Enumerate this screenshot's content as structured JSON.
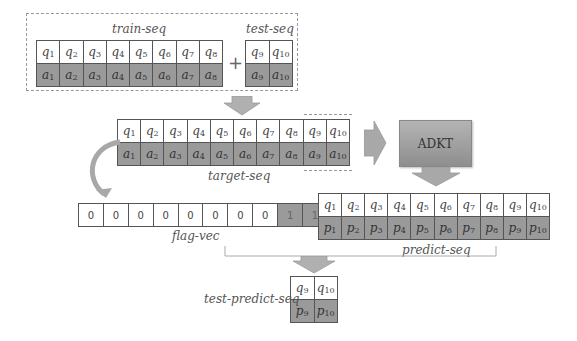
{
  "train": {
    "label": "train-seq",
    "q": [
      [
        "q",
        "1"
      ],
      [
        "q",
        "2"
      ],
      [
        "q",
        "3"
      ],
      [
        "q",
        "4"
      ],
      [
        "q",
        "5"
      ],
      [
        "q",
        "6"
      ],
      [
        "q",
        "7"
      ],
      [
        "q",
        "8"
      ]
    ],
    "a": [
      [
        "a",
        "1"
      ],
      [
        "a",
        "2"
      ],
      [
        "a",
        "3"
      ],
      [
        "a",
        "4"
      ],
      [
        "a",
        "5"
      ],
      [
        "a",
        "6"
      ],
      [
        "a",
        "7"
      ],
      [
        "a",
        "8"
      ]
    ]
  },
  "plus": "+",
  "test": {
    "label": "test-seq",
    "q": [
      [
        "q",
        "9"
      ],
      [
        "q",
        "10"
      ]
    ],
    "a": [
      [
        "a",
        "9"
      ],
      [
        "a",
        "10"
      ]
    ]
  },
  "target": {
    "label": "target-seq",
    "q": [
      [
        "q",
        "1"
      ],
      [
        "q",
        "2"
      ],
      [
        "q",
        "3"
      ],
      [
        "q",
        "4"
      ],
      [
        "q",
        "5"
      ],
      [
        "q",
        "6"
      ],
      [
        "q",
        "7"
      ],
      [
        "q",
        "8"
      ],
      [
        "q",
        "9"
      ],
      [
        "q",
        "10"
      ]
    ],
    "a": [
      [
        "a",
        "1"
      ],
      [
        "a",
        "2"
      ],
      [
        "a",
        "3"
      ],
      [
        "a",
        "4"
      ],
      [
        "a",
        "5"
      ],
      [
        "a",
        "6"
      ],
      [
        "a",
        "7"
      ],
      [
        "a",
        "8"
      ],
      [
        "a",
        "9"
      ],
      [
        "a",
        "10"
      ]
    ]
  },
  "model": {
    "label": "ADKT"
  },
  "flag": {
    "label": "flag-vec",
    "values": [
      "0",
      "0",
      "0",
      "0",
      "0",
      "0",
      "0",
      "0",
      "1",
      "1"
    ]
  },
  "predict": {
    "label": "predict-seq",
    "q": [
      [
        "q",
        "1"
      ],
      [
        "q",
        "2"
      ],
      [
        "q",
        "3"
      ],
      [
        "q",
        "4"
      ],
      [
        "q",
        "5"
      ],
      [
        "q",
        "6"
      ],
      [
        "q",
        "7"
      ],
      [
        "q",
        "8"
      ],
      [
        "q",
        "9"
      ],
      [
        "q",
        "10"
      ]
    ],
    "p": [
      [
        "p",
        "1"
      ],
      [
        "p",
        "2"
      ],
      [
        "p",
        "3"
      ],
      [
        "p",
        "4"
      ],
      [
        "p",
        "5"
      ],
      [
        "p",
        "6"
      ],
      [
        "p",
        "7"
      ],
      [
        "p",
        "8"
      ],
      [
        "p",
        "9"
      ],
      [
        "p",
        "10"
      ]
    ]
  },
  "test_predict": {
    "label": "test-predict-seq",
    "q": [
      [
        "q",
        "9"
      ],
      [
        "q",
        "10"
      ]
    ],
    "p": [
      [
        "p",
        "9"
      ],
      [
        "p",
        "10"
      ]
    ]
  },
  "colors": {
    "shaded": "#9a9a9a",
    "arrow": "#a8a8a8",
    "border": "#555555"
  }
}
